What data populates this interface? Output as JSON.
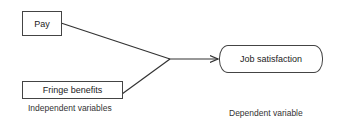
{
  "diagram": {
    "independent_vars": [
      {
        "id": "pay",
        "label": "Pay"
      },
      {
        "id": "fringe",
        "label": "Fringe benefits"
      }
    ],
    "dependent_var": {
      "id": "job_satisfaction",
      "label": "Job satisfaction"
    },
    "captions": {
      "independent": "Independent variables",
      "dependent": "Dependent variable"
    },
    "edges": [
      {
        "from": "pay",
        "to": "job_satisfaction"
      },
      {
        "from": "fringe",
        "to": "job_satisfaction"
      }
    ],
    "colors": {
      "stroke": "#333333",
      "background": "#ffffff"
    }
  }
}
